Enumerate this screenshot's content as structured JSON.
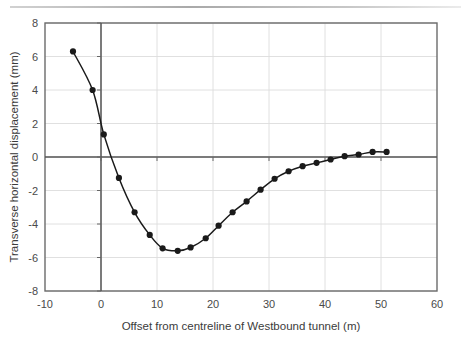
{
  "chart_data": {
    "type": "line",
    "title": "",
    "xlabel": "Offset from centreline of Westbound tunnel (m)",
    "ylabel": "Transverse horizontal displacement (mm)",
    "xlim": [
      -10,
      60
    ],
    "ylim": [
      -8,
      8
    ],
    "xticks": [
      -10,
      0,
      10,
      20,
      30,
      40,
      50,
      60
    ],
    "yticks": [
      8,
      6,
      4,
      2,
      0,
      -2,
      -4,
      -6,
      -8
    ],
    "xtick_labels": [
      "-10",
      "0",
      "10",
      "20",
      "30",
      "40",
      "50",
      "60"
    ],
    "ytick_labels": [
      "8",
      "6",
      "4",
      "2",
      "0",
      "-2",
      "-4",
      "-6",
      "-8"
    ],
    "grid": true,
    "grid_color": "#d9d9d9",
    "legend": null,
    "series": [
      {
        "name": "Transverse horizontal displacement",
        "marker": "filled-circle",
        "marker_color": "#1a1a1a",
        "line_color": "#1a1a1a",
        "x": [
          -5.0,
          -1.5,
          0.5,
          3.2,
          6.0,
          8.7,
          11.0,
          13.7,
          16.0,
          18.7,
          21.0,
          23.5,
          26.0,
          28.5,
          31.0,
          33.5,
          36.0,
          38.5,
          41.0,
          43.5,
          46.0,
          48.5,
          51.0
        ],
        "y": [
          6.3,
          4.0,
          1.35,
          -1.25,
          -3.3,
          -4.65,
          -5.45,
          -5.6,
          -5.4,
          -4.85,
          -4.1,
          -3.3,
          -2.65,
          -1.95,
          -1.3,
          -0.85,
          -0.55,
          -0.35,
          -0.15,
          0.05,
          0.15,
          0.3,
          0.3
        ]
      }
    ],
    "zero_line_y": 0,
    "zero_line_x": 0
  },
  "axes": {
    "x_axis_title": "Offset from centreline of Westbound tunnel (m)",
    "y_axis_title": "Transverse horizontal displacement (mm)"
  },
  "colors": {
    "frame": "#6b6b6b",
    "grid": "#dcdcdc",
    "data": "#151515",
    "text": "#444444",
    "background": "#ffffff"
  }
}
